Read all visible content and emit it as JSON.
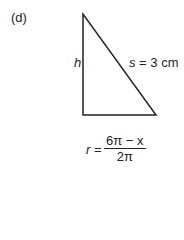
{
  "panel_label": "(d)",
  "triangle": {
    "side_vertical_label": "h",
    "hypotenuse_label_var": "s",
    "hypotenuse_label_value": " = 3 cm"
  },
  "formula": {
    "lhs": "r",
    "eq": " =",
    "numerator": "6π − x",
    "denominator": "2π"
  }
}
